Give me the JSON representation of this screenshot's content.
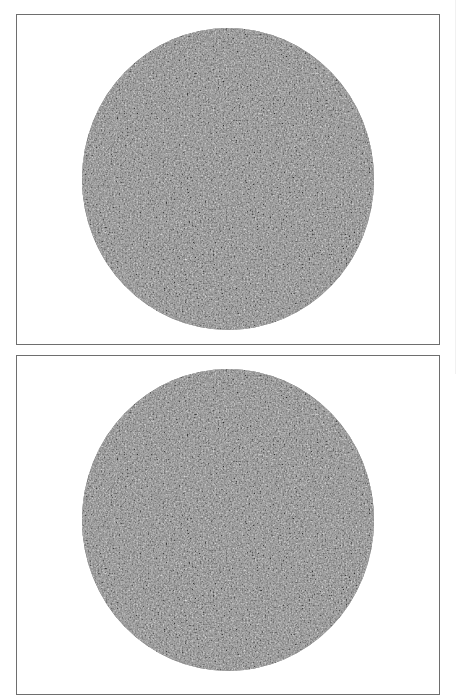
{
  "figure": {
    "panels": [
      {
        "id": "panel-1",
        "content": "noise-textured-disc",
        "disc": {
          "center_x": 227,
          "center_y": 179,
          "radius_x": 146,
          "radius_y": 151,
          "base_color": "#8c8c8c",
          "speckle_dark": "#3c3c3c",
          "speckle_light": "#e6e6e6"
        }
      },
      {
        "id": "panel-2",
        "content": "noise-textured-disc",
        "partially_visible": true
      }
    ],
    "colors": {
      "background": "#ffffff",
      "frame_border": "#6e6e6e"
    }
  }
}
